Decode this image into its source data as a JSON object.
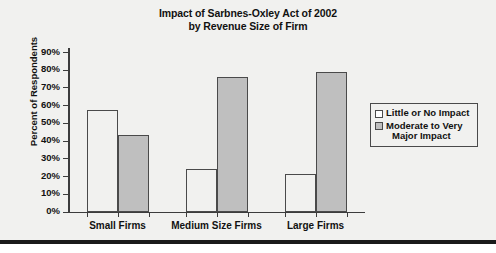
{
  "chart_data": {
    "type": "bar",
    "title": "Impact of Sarbnes-Oxley Act of 2002 by Revenue Size of Firm",
    "title_line1": "Impact of Sarbnes-Oxley Act of 2002",
    "title_line2": "by Revenue Size of Firm",
    "xlabel": "",
    "ylabel": "Percent of Respondents",
    "categories": [
      "Small Firms",
      "Medium Size Firms",
      "Large Firms"
    ],
    "series": [
      {
        "name": "Little or No Impact",
        "name_line1": "Little or No Impact",
        "name_line2": "",
        "color": "#FFFFFF",
        "values": [
          57,
          24,
          21
        ]
      },
      {
        "name": "Moderate to Very Major Impact",
        "name_line1": "Moderate to Very",
        "name_line2": "Major Impact",
        "color": "#BFBFBF",
        "values": [
          43,
          76,
          79
        ]
      }
    ],
    "ylim": [
      0,
      90
    ],
    "ytick_values": [
      90,
      80,
      70,
      60,
      50,
      40,
      30,
      20,
      10,
      0
    ],
    "ytick_labels": [
      "90%",
      "80%",
      "70%",
      "60%",
      "50%",
      "40%",
      "30%",
      "20%",
      "10%",
      "0%"
    ],
    "grid": false,
    "legend_position": "right"
  },
  "figure": {
    "background_color": "#F1F1EF",
    "axis_color": "#3C3C3C",
    "bar_edge_color": "#4A4A4A"
  }
}
